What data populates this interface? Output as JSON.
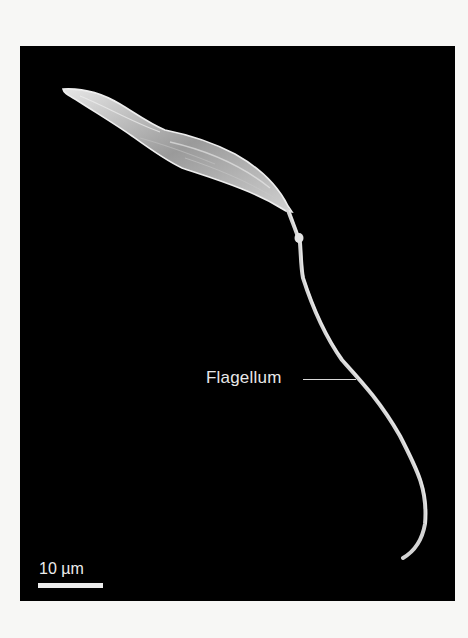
{
  "figure": {
    "type": "scanning electron micrograph",
    "background_color": "#000000",
    "page_color": "#f7f7f5",
    "specimen_color": "#d9d9d9"
  },
  "annotations": {
    "flagellum_label": "Flagellum"
  },
  "scale_bar": {
    "label": "10 µm",
    "length_px": 65
  }
}
